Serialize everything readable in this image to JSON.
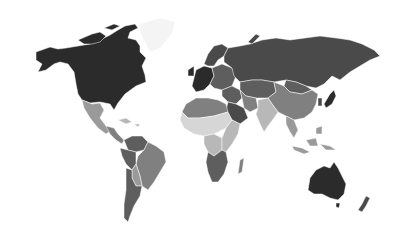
{
  "map": {
    "type": "choropleth",
    "projection": "world",
    "legend_visible": false,
    "palette": {
      "darkest": "#2b2b2b",
      "dark": "#4a4a4a",
      "mid_dark": "#5e5e5e",
      "mid": "#808080",
      "mid_light": "#9a9a9a",
      "light": "#b8b8b8",
      "lightest": "#d6d6d6",
      "background": "#ffffff"
    },
    "regions": [
      {
        "name": "North America (Canada, USA)",
        "shade": "darkest"
      },
      {
        "name": "Greenland",
        "shade": "background"
      },
      {
        "name": "Mexico",
        "shade": "mid_light"
      },
      {
        "name": "Central America",
        "shade": "mid"
      },
      {
        "name": "Caribbean",
        "shade": "light"
      },
      {
        "name": "Colombia / Venezuela",
        "shade": "mid_dark"
      },
      {
        "name": "Brazil",
        "shade": "mid"
      },
      {
        "name": "Peru / Ecuador",
        "shade": "mid_dark"
      },
      {
        "name": "Bolivia / Paraguay",
        "shade": "mid_light"
      },
      {
        "name": "Argentina / Chile",
        "shade": "mid_dark"
      },
      {
        "name": "Western Europe",
        "shade": "darkest"
      },
      {
        "name": "Scandinavia",
        "shade": "dark"
      },
      {
        "name": "Eastern Europe",
        "shade": "mid_dark"
      },
      {
        "name": "Russia",
        "shade": "dark"
      },
      {
        "name": "Central Asia",
        "shade": "mid_dark"
      },
      {
        "name": "Mongolia",
        "shade": "mid_dark"
      },
      {
        "name": "China",
        "shade": "mid"
      },
      {
        "name": "Japan",
        "shade": "darkest"
      },
      {
        "name": "Korea",
        "shade": "dark"
      },
      {
        "name": "Middle East",
        "shade": "mid_dark"
      },
      {
        "name": "Saudi Arabia",
        "shade": "dark"
      },
      {
        "name": "Iran",
        "shade": "mid"
      },
      {
        "name": "India",
        "shade": "light"
      },
      {
        "name": "Southeast Asia",
        "shade": "mid_light"
      },
      {
        "name": "Indonesia",
        "shade": "mid_light"
      },
      {
        "name": "North Africa",
        "shade": "mid"
      },
      {
        "name": "West Africa",
        "shade": "lightest"
      },
      {
        "name": "Central Africa",
        "shade": "light"
      },
      {
        "name": "East Africa",
        "shade": "light"
      },
      {
        "name": "Southern Africa",
        "shade": "mid_dark"
      },
      {
        "name": "Madagascar",
        "shade": "mid"
      },
      {
        "name": "Australia",
        "shade": "darkest"
      },
      {
        "name": "New Zealand",
        "shade": "dark"
      }
    ]
  }
}
